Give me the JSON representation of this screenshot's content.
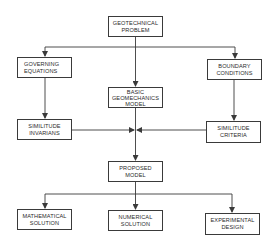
{
  "diagram": {
    "type": "flowchart",
    "colors": {
      "line": "#3a3a3a",
      "text": "#2a2a2a",
      "background": "#ffffff"
    },
    "nodes": {
      "geotechnical_problem": {
        "line1": "GEOTECHNICAL",
        "line2": "PROBLEM"
      },
      "governing_equations": {
        "line1": "GOVERNING",
        "line2": "EQUATIONS"
      },
      "boundary_conditions": {
        "line1": "BOUNDARY",
        "line2": "CONDITIONS"
      },
      "basic_geomechanics_model": {
        "line1": "BASIC",
        "line2": "GEOMECHANICS",
        "line3": "MODEL"
      },
      "similitude_invarians": {
        "line1": "SIMILITUDE",
        "line2": "INVARIANS"
      },
      "similitude_criteria": {
        "line1": "SIMILITUDE",
        "line2": "CRITERIA"
      },
      "proposed_model": {
        "line1": "PROPOSED",
        "line2": "MODEL"
      },
      "mathematical_solution": {
        "line1": "MATHEMATICAL",
        "line2": "SOLUTION"
      },
      "numerical_solution": {
        "line1": "NUMERICAL",
        "line2": "SOLUTION"
      },
      "experimental_design": {
        "line1": "EXPERIMENTAL",
        "line2": "DESIGN"
      }
    },
    "edges": [
      {
        "from": "GEOTECHNICAL PROBLEM",
        "to": "GOVERNING EQUATIONS"
      },
      {
        "from": "GEOTECHNICAL PROBLEM",
        "to": "BASIC GEOMECHANICS MODEL"
      },
      {
        "from": "GEOTECHNICAL PROBLEM",
        "to": "BOUNDARY CONDITIONS"
      },
      {
        "from": "GOVERNING EQUATIONS",
        "to": "SIMILITUDE INVARIANS"
      },
      {
        "from": "BOUNDARY CONDITIONS",
        "to": "SIMILITUDE CRITERIA"
      },
      {
        "from": "SIMILITUDE INVARIANS",
        "to": "PROPOSED MODEL"
      },
      {
        "from": "SIMILITUDE CRITERIA",
        "to": "PROPOSED MODEL"
      },
      {
        "from": "BASIC GEOMECHANICS MODEL",
        "to": "PROPOSED MODEL"
      },
      {
        "from": "PROPOSED MODEL",
        "to": "MATHEMATICAL SOLUTION"
      },
      {
        "from": "PROPOSED MODEL",
        "to": "NUMERICAL SOLUTION"
      },
      {
        "from": "PROPOSED MODEL",
        "to": "EXPERIMENTAL DESIGN"
      }
    ]
  }
}
